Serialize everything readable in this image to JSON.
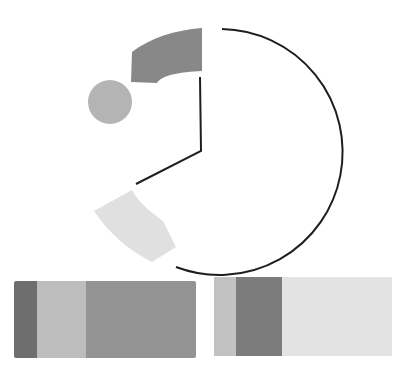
{
  "diagram": {
    "pie": {
      "center": [
        201,
        150
      ],
      "radius": 123,
      "arc_color": "#1e1e1e",
      "wedges": [
        {
          "name": "dark-wedge",
          "color": "#888888"
        },
        {
          "name": "light-wedge",
          "color": "#e0e0e0"
        }
      ],
      "circle": {
        "cx": 110,
        "cy": 102,
        "r": 22,
        "color": "#b4b4b4"
      }
    },
    "bars": {
      "left": {
        "segments": [
          {
            "name": "dark",
            "color": "#6e6e6e",
            "width": 23
          },
          {
            "name": "light",
            "color": "#bdbdbd",
            "width": 49
          },
          {
            "name": "medium",
            "color": "#939393",
            "width": 110
          }
        ]
      },
      "right": {
        "segments": [
          {
            "name": "light",
            "color": "#c2c2c2",
            "width": 22
          },
          {
            "name": "dark",
            "color": "#7c7c7c",
            "width": 46
          },
          {
            "name": "very-light",
            "color": "#e3e3e3",
            "width": 110
          }
        ]
      }
    }
  }
}
